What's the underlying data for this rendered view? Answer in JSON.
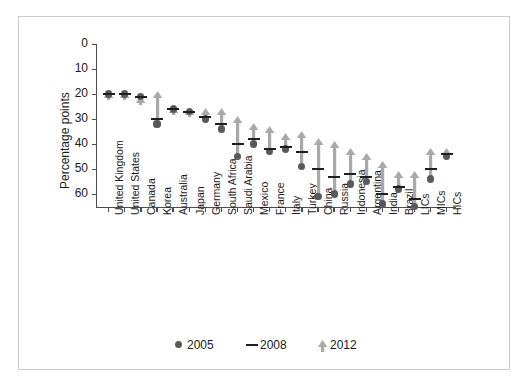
{
  "chart_data": {
    "type": "scatter",
    "title": "",
    "xlabel": "",
    "ylabel": "Percentage points",
    "ylim": [
      0,
      65
    ],
    "y_inverted": true,
    "yticks": [
      0,
      10,
      20,
      30,
      40,
      50,
      60
    ],
    "grid": false,
    "legend_position": "bottom-center",
    "legend": [
      {
        "name": "2005",
        "marker": "circle",
        "color": "#595959"
      },
      {
        "name": "2008",
        "marker": "dash",
        "color": "#1f1f1f"
      },
      {
        "name": "2012",
        "marker": "arrow-up",
        "color": "#a6a6a6"
      }
    ],
    "categories": [
      "United Kingdom",
      "United States",
      "Canada",
      "Korea",
      "Australia",
      "Japan",
      "Germany",
      "South Africa",
      "Saudi Arabia",
      "Mexico",
      "France",
      "Italy",
      "Turkey",
      "China",
      "Russia",
      "Indonesia",
      "Argentina",
      "India",
      "Brazil",
      "LICs",
      "MICs",
      "HICs"
    ],
    "series": [
      {
        "name": "2005",
        "values": [
          20,
          20,
          21,
          32,
          26,
          27,
          30,
          34,
          45,
          40,
          43,
          42,
          49,
          61,
          60,
          56,
          55,
          64,
          58,
          65,
          54,
          45
        ]
      },
      {
        "name": "2008",
        "values": [
          20,
          20,
          21,
          30,
          26,
          27,
          29,
          32,
          40,
          38,
          42,
          41,
          43,
          50,
          53,
          52,
          53,
          60,
          57,
          62,
          50,
          44
        ]
      },
      {
        "name": "2012",
        "values": [
          19,
          19,
          21,
          19,
          25,
          26,
          26,
          26,
          29,
          32,
          33,
          36,
          35,
          38,
          39,
          42,
          44,
          47,
          51,
          51,
          42,
          42
        ]
      }
    ]
  },
  "axis": {
    "ylabel": "Percentage points",
    "ytick_labels": [
      "0",
      "10",
      "20",
      "30",
      "40",
      "50",
      "60"
    ]
  },
  "legend": {
    "items": [
      "2005",
      "2008",
      "2012"
    ]
  }
}
